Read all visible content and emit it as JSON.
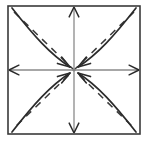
{
  "diagram": {
    "canvas": {
      "width": 149,
      "height": 141,
      "background": "#ffffff"
    },
    "frame": {
      "name": "square-border",
      "x": 8,
      "y": 6,
      "width": 132,
      "height": 128,
      "stroke": "#3a3a3a",
      "stroke_width": 1.6,
      "fill": "none"
    },
    "center": {
      "x": 74,
      "y": 70
    },
    "axes": {
      "stroke": "#8a8a8a",
      "stroke_width": 1.3,
      "arrow_stroke": "#2b2b2b",
      "arrow_direction": "outward",
      "items": [
        {
          "name": "axis-vertical",
          "x1": 74,
          "y1": 6,
          "x2": 74,
          "y2": 134
        },
        {
          "name": "axis-horizontal",
          "x1": 8,
          "y1": 70,
          "x2": 140,
          "y2": 70
        }
      ],
      "arrow_tips": [
        {
          "name": "axis-arrow-up",
          "x": 74,
          "y": 7,
          "angle": -90
        },
        {
          "name": "axis-arrow-down",
          "x": 74,
          "y": 133,
          "angle": 90
        },
        {
          "name": "axis-arrow-left",
          "x": 9,
          "y": 70,
          "angle": 180
        },
        {
          "name": "axis-arrow-right",
          "x": 139,
          "y": 70,
          "angle": 0
        }
      ]
    },
    "diagonals": {
      "stroke": "#3a3a3a",
      "stroke_width": 1.5,
      "dash_pattern": "7 6",
      "items": [
        {
          "name": "diagonal-dashed-nw-se",
          "x1": 14,
          "y1": 12,
          "x2": 134,
          "y2": 128
        },
        {
          "name": "diagonal-dashed-ne-sw",
          "x1": 134,
          "y1": 12,
          "x2": 14,
          "y2": 128
        }
      ]
    },
    "curves": {
      "stroke": "#2b2b2b",
      "stroke_width": 1.7,
      "fill": "none",
      "arrowhead_target": "center",
      "items": [
        {
          "name": "curve-arrow-from-top-left",
          "from_corner": "top-left",
          "path": "M 12 8 C 34 36, 50 54, 70 67",
          "arrow_angle": 33
        },
        {
          "name": "curve-arrow-from-top-right",
          "from_corner": "top-right",
          "path": "M 136 8 C 114 36, 98 54, 78 67",
          "arrow_angle": 147
        },
        {
          "name": "curve-arrow-from-bottom-left",
          "from_corner": "bottom-left",
          "path": "M 12 132 C 34 104, 50 86, 70 73",
          "arrow_angle": -33
        },
        {
          "name": "curve-arrow-from-bottom-right",
          "from_corner": "bottom-right",
          "path": "M 136 132 C 114 104, 98 86, 78 73",
          "arrow_angle": -147
        }
      ]
    }
  }
}
